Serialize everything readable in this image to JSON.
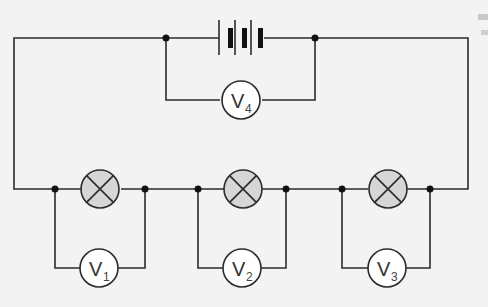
{
  "diagram": {
    "type": "circuit",
    "components": {
      "battery": {
        "cells": 3,
        "label": ""
      },
      "lamps": [
        {
          "id": "lamp-1"
        },
        {
          "id": "lamp-2"
        },
        {
          "id": "lamp-3"
        }
      ],
      "voltmeters": [
        {
          "id": "V1",
          "symbol": "V",
          "subscript": "1",
          "across": "lamp-1"
        },
        {
          "id": "V2",
          "symbol": "V",
          "subscript": "2",
          "across": "lamp-2"
        },
        {
          "id": "V3",
          "symbol": "V",
          "subscript": "3",
          "across": "lamp-3"
        },
        {
          "id": "V4",
          "symbol": "V",
          "subscript": "4",
          "across": "battery"
        }
      ]
    },
    "colors": {
      "background": "#f3f3f3",
      "wire": "#2b2b2b",
      "lamp_fill": "#d6d6d6",
      "meter_fill": "#ffffff"
    }
  }
}
